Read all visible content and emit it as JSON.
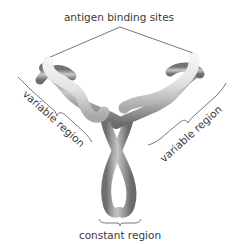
{
  "diagram": {
    "labels": {
      "top": "antigen binding sites",
      "left": "variable region",
      "right": "variable region",
      "bottom": "constant region"
    },
    "colors": {
      "background": "#ffffff",
      "text": "#3a3a3a",
      "leader_lines": "#555555",
      "light_tube": "#dcdcdc",
      "dark_tube": "#8e8e8e"
    }
  }
}
